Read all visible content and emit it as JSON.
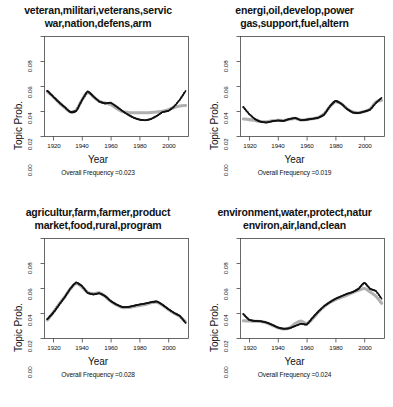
{
  "figure": {
    "axis_labels": {
      "x": "Year",
      "y": "Topic Prob."
    },
    "yticks": [
      "0.00",
      "0.02",
      "0.04",
      "0.06",
      "0.08"
    ],
    "xticks": [
      "1920",
      "1940",
      "1960",
      "1980",
      "2000"
    ],
    "colors": {
      "smooth": "#b0b0b0",
      "observed": "#111111",
      "frame": "#444444"
    }
  },
  "panels": [
    {
      "title_line1": "veteran,militari,veterans,servic",
      "title_line2": "war,nation,defens,arm",
      "freq_label": "Overall Frequency =0.023",
      "xlabel": "Year",
      "ylabel": "Topic Prob."
    },
    {
      "title_line1": "energi,oil,develop,power",
      "title_line2": "gas,support,fuel,altern",
      "freq_label": "Overall Frequency =0.019",
      "xlabel": "Year",
      "ylabel": "Topic Prob."
    },
    {
      "title_line1": "agricultur,farm,farmer,product",
      "title_line2": "market,food,rural,program",
      "freq_label": "Overall Frequency =0.028",
      "xlabel": "Year",
      "ylabel": "Topic Prob."
    },
    {
      "title_line1": "environment,water,protect,natur",
      "title_line2": "environ,air,land,clean",
      "freq_label": "Overall Frequency =0.024",
      "xlabel": "Year",
      "ylabel": "Topic Prob."
    }
  ],
  "chart_data": [
    {
      "type": "line",
      "title": "veteran,militari,veterans,servic war,nation,defens,arm",
      "xlabel": "Year",
      "ylabel": "Topic Prob.",
      "xlim": [
        1915,
        2015
      ],
      "ylim": [
        0.0,
        0.08
      ],
      "grid": false,
      "legend": "none",
      "annotation": "Overall Frequency =0.023",
      "x": [
        1917,
        1921,
        1925,
        1929,
        1933,
        1937,
        1941,
        1945,
        1949,
        1953,
        1957,
        1961,
        1965,
        1969,
        1973,
        1977,
        1981,
        1985,
        1989,
        1993,
        1997,
        2001,
        2005,
        2009,
        2013
      ],
      "series": [
        {
          "name": "observed",
          "values": [
            0.0365,
            0.032,
            0.0275,
            0.0235,
            0.0195,
            0.0205,
            0.029,
            0.036,
            0.032,
            0.028,
            0.0265,
            0.027,
            0.024,
            0.0205,
            0.0175,
            0.015,
            0.0135,
            0.013,
            0.014,
            0.0165,
            0.0195,
            0.0205,
            0.024,
            0.0295,
            0.0365
          ]
        },
        {
          "name": "smoothed",
          "values": [
            0.036,
            0.0318,
            0.0272,
            0.0232,
            0.0196,
            0.021,
            0.0292,
            0.0352,
            0.0318,
            0.0282,
            0.0268,
            0.0255,
            0.0225,
            0.02,
            0.0192,
            0.019,
            0.019,
            0.019,
            0.0192,
            0.0196,
            0.0202,
            0.0215,
            0.0232,
            0.0244,
            0.0248
          ]
        }
      ]
    },
    {
      "type": "line",
      "title": "energi,oil,develop,power gas,support,fuel,altern",
      "xlabel": "Year",
      "ylabel": "Topic Prob.",
      "xlim": [
        1915,
        2015
      ],
      "ylim": [
        0.0,
        0.08
      ],
      "grid": false,
      "legend": "none",
      "annotation": "Overall Frequency =0.019",
      "x": [
        1917,
        1921,
        1925,
        1929,
        1933,
        1937,
        1941,
        1945,
        1949,
        1953,
        1957,
        1961,
        1965,
        1969,
        1973,
        1977,
        1981,
        1985,
        1989,
        1993,
        1997,
        2001,
        2005,
        2009,
        2013
      ],
      "series": [
        {
          "name": "observed",
          "values": [
            0.0235,
            0.018,
            0.014,
            0.0118,
            0.0112,
            0.0122,
            0.0128,
            0.0125,
            0.014,
            0.0148,
            0.013,
            0.0135,
            0.0142,
            0.015,
            0.0175,
            0.024,
            0.0285,
            0.0262,
            0.022,
            0.0192,
            0.0188,
            0.02,
            0.0215,
            0.0268,
            0.031
          ]
        },
        {
          "name": "smoothed",
          "values": [
            0.014,
            0.0135,
            0.0128,
            0.012,
            0.0118,
            0.0126,
            0.013,
            0.0128,
            0.0138,
            0.0145,
            0.0132,
            0.0136,
            0.0142,
            0.0152,
            0.018,
            0.0238,
            0.0278,
            0.0262,
            0.0222,
            0.0196,
            0.019,
            0.02,
            0.022,
            0.0276,
            0.029
          ]
        }
      ]
    },
    {
      "type": "line",
      "title": "agricultur,farm,farmer,product market,food,rural,program",
      "xlabel": "Year",
      "ylabel": "Topic Prob.",
      "xlim": [
        1915,
        2015
      ],
      "ylim": [
        0.0,
        0.08
      ],
      "grid": false,
      "legend": "none",
      "annotation": "Overall Frequency =0.028",
      "x": [
        1917,
        1921,
        1925,
        1929,
        1933,
        1937,
        1941,
        1945,
        1949,
        1953,
        1957,
        1961,
        1965,
        1969,
        1973,
        1977,
        1981,
        1985,
        1989,
        1993,
        1997,
        2001,
        2005,
        2009,
        2013
      ],
      "series": [
        {
          "name": "observed",
          "values": [
            0.0155,
            0.0205,
            0.0268,
            0.033,
            0.04,
            0.0448,
            0.042,
            0.0365,
            0.0352,
            0.0362,
            0.034,
            0.03,
            0.0272,
            0.0252,
            0.0252,
            0.0262,
            0.0272,
            0.028,
            0.029,
            0.0296,
            0.027,
            0.0235,
            0.0205,
            0.018,
            0.0125
          ]
        },
        {
          "name": "smoothed",
          "values": [
            0.0148,
            0.0208,
            0.0272,
            0.0332,
            0.0398,
            0.044,
            0.0412,
            0.0368,
            0.036,
            0.0365,
            0.0338,
            0.0298,
            0.0268,
            0.0248,
            0.0248,
            0.0256,
            0.0264,
            0.0272,
            0.0286,
            0.029,
            0.0266,
            0.0232,
            0.0202,
            0.0176,
            0.0132
          ]
        }
      ]
    },
    {
      "type": "line",
      "title": "environment,water,protect,natur environ,air,land,clean",
      "xlabel": "Year",
      "ylabel": "Topic Prob.",
      "xlim": [
        1915,
        2015
      ],
      "ylim": [
        0.0,
        0.08
      ],
      "grid": false,
      "legend": "none",
      "annotation": "Overall Frequency =0.024",
      "x": [
        1917,
        1921,
        1925,
        1929,
        1933,
        1937,
        1941,
        1945,
        1949,
        1953,
        1957,
        1961,
        1965,
        1969,
        1973,
        1977,
        1981,
        1985,
        1989,
        1993,
        1997,
        2001,
        2005,
        2009,
        2013
      ],
      "series": [
        {
          "name": "observed",
          "values": [
            0.0195,
            0.015,
            0.014,
            0.0138,
            0.0128,
            0.011,
            0.0088,
            0.0078,
            0.0082,
            0.01,
            0.0118,
            0.0112,
            0.0165,
            0.0215,
            0.0258,
            0.029,
            0.0318,
            0.0338,
            0.0358,
            0.0372,
            0.0398,
            0.0445,
            0.0398,
            0.038,
            0.0318
          ]
        },
        {
          "name": "smoothed",
          "values": [
            0.0142,
            0.014,
            0.0138,
            0.0136,
            0.0126,
            0.0105,
            0.0085,
            0.0076,
            0.0085,
            0.012,
            0.014,
            0.012,
            0.0158,
            0.021,
            0.0255,
            0.0288,
            0.0312,
            0.033,
            0.0348,
            0.0368,
            0.0385,
            0.04,
            0.0372,
            0.0338,
            0.0282
          ]
        }
      ]
    }
  ]
}
